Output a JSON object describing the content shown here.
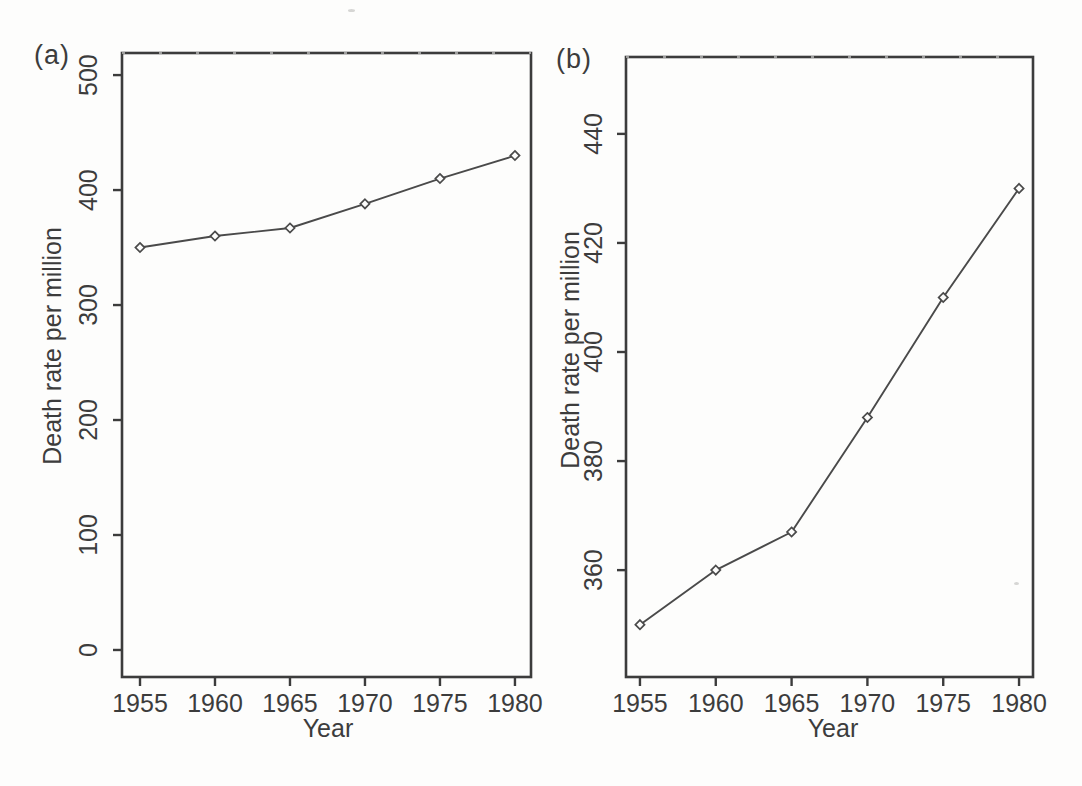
{
  "page": {
    "background": "#fdfdfc",
    "ink_color": "#3c3c3c",
    "line_color": "#4a4a4a"
  },
  "chart_data": [
    {
      "type": "line",
      "panel_label": "(a)",
      "xlabel": "Year",
      "ylabel": "Death rate per million",
      "x": [
        1955,
        1960,
        1965,
        1970,
        1975,
        1980
      ],
      "values": [
        350,
        360,
        367,
        388,
        410,
        430
      ],
      "xticks": [
        1955,
        1960,
        1965,
        1970,
        1975,
        1980
      ],
      "yticks": [
        0,
        100,
        200,
        300,
        400,
        500
      ],
      "xlim": [
        1953.8,
        1981.07
      ],
      "ylim": [
        -23.5,
        519.2
      ],
      "marker": "open-diamond",
      "line_style": "solid",
      "grid": false,
      "legend": "none"
    },
    {
      "type": "line",
      "panel_label": "(b)",
      "xlabel": "Year",
      "ylabel": "Death rate per million",
      "x": [
        1955,
        1960,
        1965,
        1970,
        1975,
        1980
      ],
      "values": [
        350,
        360,
        367,
        388,
        410,
        430
      ],
      "xticks": [
        1955,
        1960,
        1965,
        1970,
        1975,
        1980
      ],
      "yticks": [
        360,
        380,
        400,
        420,
        440
      ],
      "xlim": [
        1954.08,
        1980.92
      ],
      "ylim": [
        340.4,
        454.1
      ],
      "marker": "open-diamond",
      "line_style": "solid",
      "grid": false,
      "legend": "none"
    }
  ]
}
